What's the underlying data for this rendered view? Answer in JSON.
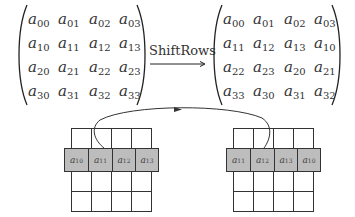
{
  "operation": {
    "label": "ShiftRows",
    "arrow": "right-arrow"
  },
  "input_matrix": {
    "symbol": "a",
    "rows": [
      [
        "00",
        "01",
        "02",
        "03"
      ],
      [
        "10",
        "11",
        "12",
        "13"
      ],
      [
        "20",
        "21",
        "22",
        "23"
      ],
      [
        "30",
        "31",
        "32",
        "33"
      ]
    ]
  },
  "output_matrix": {
    "symbol": "a",
    "rows": [
      [
        "00",
        "01",
        "02",
        "03"
      ],
      [
        "11",
        "12",
        "13",
        "10"
      ],
      [
        "22",
        "23",
        "20",
        "21"
      ],
      [
        "33",
        "30",
        "31",
        "32"
      ]
    ]
  },
  "state_before": {
    "highlighted_row": [
      "10",
      "11",
      "12",
      "13"
    ],
    "shade_color": "#bdbdbd"
  },
  "state_after": {
    "highlighted_row": [
      "11",
      "12",
      "13",
      "10"
    ],
    "shade_color": "#bdbdbd"
  },
  "curve_arrow": {
    "from": "a10 position (left grid, row 1)",
    "to": "last position (right grid, row 1)"
  }
}
